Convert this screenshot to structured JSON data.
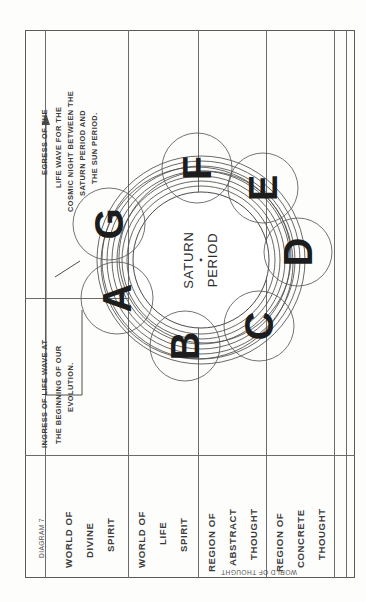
{
  "plate": {
    "diagram_number": "DIAGRAM 7",
    "orientation_note": "chart printed sideways; text reads bottom-to-top"
  },
  "center": {
    "line1": "SATURN",
    "line2": "PERIOD"
  },
  "globes": [
    {
      "id": "A",
      "label": "A"
    },
    {
      "id": "B",
      "label": "B"
    },
    {
      "id": "C",
      "label": "C"
    },
    {
      "id": "D",
      "label": "D"
    },
    {
      "id": "E",
      "label": "E"
    },
    {
      "id": "F",
      "label": "F"
    },
    {
      "id": "G",
      "label": "G"
    }
  ],
  "annotations": {
    "egress": {
      "lines": [
        "EGRESS OF THE",
        "LIFE WAVE FOR THE",
        "COSMIC NIGHT BETWEEN THE",
        "SATURN PERIOD AND",
        "THE SUN PERIOD."
      ]
    },
    "ingress": {
      "lines": [
        "INGRESS OF LIFE WAVE AT",
        "THE BEGINNING OF OUR",
        "EVOLUTION."
      ]
    }
  },
  "legend": {
    "rows": [
      {
        "name": "diagram-number",
        "lines": [
          "DIAGRAM 7"
        ]
      },
      {
        "name": "world-of-divine-spirit",
        "lines": [
          "WORLD OF",
          "DIVINE",
          "SPIRIT"
        ]
      },
      {
        "name": "world-of-life-spirit",
        "lines": [
          "WORLD OF",
          "LIFE",
          "SPIRIT"
        ]
      },
      {
        "name": "region-of-abstract-thought",
        "lines": [
          "REGION OF",
          "ABSTRACT",
          "THOUGHT"
        ]
      },
      {
        "name": "region-of-concrete-thought",
        "lines": [
          "REGION OF",
          "CONCRETE",
          "THOUGHT"
        ]
      }
    ],
    "bracket_label": "WORLD OF THOUGHT"
  },
  "colors": {
    "ink": "#3b3b3b",
    "rule": "#6b6b6b",
    "paper": "#fdfdfc",
    "glyph": "#1d1d1d"
  }
}
